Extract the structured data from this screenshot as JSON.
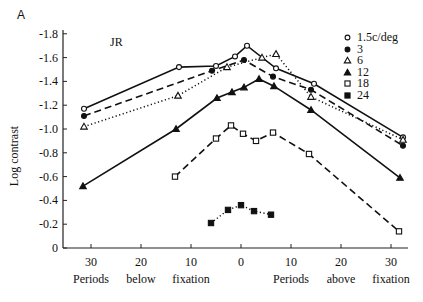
{
  "panel_label": "A",
  "subject": "JR",
  "chart_data": {
    "type": "line",
    "title": "",
    "ylabel": "Log contrast",
    "xlabel": "Periods below fixation / Periods above fixation",
    "ylim": [
      0,
      -1.8
    ],
    "xlim": [
      -35,
      35
    ],
    "y_ticks": [
      "-1.8",
      "-1.6",
      "-1.4",
      "-1.2",
      "-1.0",
      "-0.8",
      "-0.6",
      "-0.4",
      "-0.2",
      "0"
    ],
    "x_ticks": [
      "30",
      "20",
      "10",
      "0",
      "10",
      "20",
      "30"
    ],
    "x_sublabels": [
      "Periods",
      "below",
      "fixation",
      "Periods",
      "above",
      "fixation"
    ],
    "grid": false,
    "legend_position": "upper right",
    "series": [
      {
        "name": "1.5c/deg",
        "marker": "open-circle",
        "line": "solid",
        "x": [
          -31.4,
          -12.4,
          -5,
          -1.2,
          1.2,
          7,
          14.6,
          32.4
        ],
        "y": [
          -1.17,
          -1.52,
          -1.53,
          -1.61,
          -1.7,
          -1.51,
          -1.38,
          -0.93
        ]
      },
      {
        "name": "3",
        "marker": "filled-circle",
        "line": "dashed",
        "x": [
          -31.4,
          -5.8,
          0.6,
          6.4,
          14,
          32.4
        ],
        "y": [
          -1.11,
          -1.49,
          -1.58,
          -1.44,
          -1.33,
          -0.86
        ]
      },
      {
        "name": "6",
        "marker": "open-triangle",
        "line": "dotted",
        "x": [
          -31.4,
          -12.6,
          -2.8,
          4.2,
          7,
          14,
          32.4
        ],
        "y": [
          -1.02,
          -1.28,
          -1.52,
          -1.6,
          -1.63,
          -1.27,
          -0.91
        ]
      },
      {
        "name": "12",
        "marker": "filled-triangle",
        "line": "solid",
        "x": [
          -31.6,
          -13,
          -4.8,
          -1.8,
          0.6,
          3.6,
          6.6,
          14,
          31.8
        ],
        "y": [
          -0.52,
          -1.0,
          -1.26,
          -1.31,
          -1.35,
          -1.42,
          -1.36,
          -1.16,
          -0.59
        ]
      },
      {
        "name": "18",
        "marker": "open-square",
        "line": "dashed",
        "x": [
          -13.2,
          -5,
          -2,
          0.4,
          3,
          6.4,
          13.6,
          31.6
        ],
        "y": [
          -0.6,
          -0.92,
          -1.03,
          -0.96,
          -0.9,
          -0.97,
          -0.79,
          -0.14
        ]
      },
      {
        "name": "24",
        "marker": "filled-square",
        "line": "dotted",
        "x": [
          -6,
          -2.6,
          0,
          2.6,
          6
        ],
        "y": [
          -0.21,
          -0.32,
          -0.36,
          -0.31,
          -0.28
        ]
      }
    ]
  }
}
